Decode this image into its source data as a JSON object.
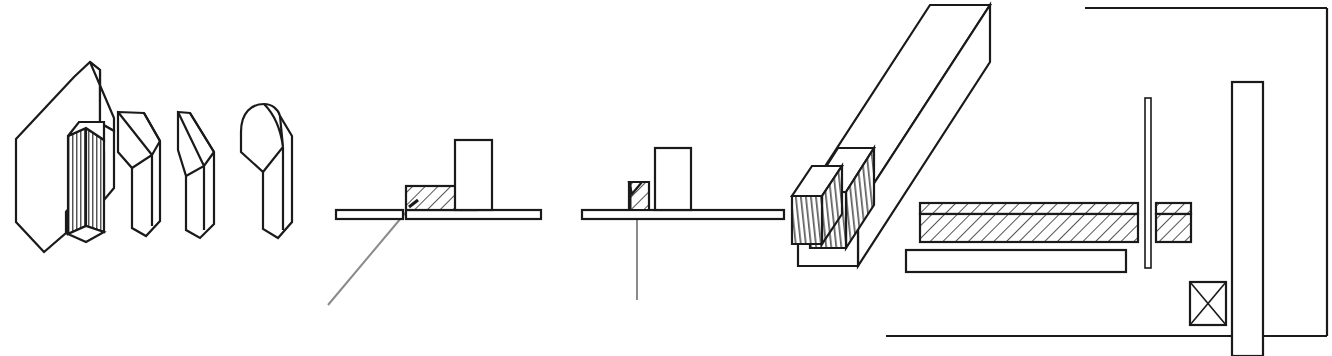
{
  "sheet": {
    "title": "Technical line drawing sheet",
    "width": 1332,
    "height": 356,
    "background_color": "#ffffff",
    "ink_color": "#1a1a1a",
    "leader_color": "#8a8a8a"
  },
  "figures": [
    {
      "id": "fig-left-blade-group",
      "name": "isometric-blade-group",
      "description": "Group of four isometric prismatic blade/chisel tip bodies; leftmost is a large bevelled block with a vertically line-shaded inner post",
      "parts": [
        {
          "name": "large-bevelled-block",
          "shading": "none"
        },
        {
          "name": "ribbed-inner-post",
          "shading": "vertical-line-shading"
        },
        {
          "name": "single-bevel-blade",
          "shading": "none"
        },
        {
          "name": "double-bevel-point-blade",
          "shading": "none"
        },
        {
          "name": "round-nose-blade",
          "shading": "none"
        }
      ]
    },
    {
      "id": "fig-section-a",
      "name": "cross-section-left",
      "description": "Sectional side view: thin horizontal plate split at a seam, a cross-hatched rectangular block seated on the plate, an unhatched upright rectangle to its right, and a grey leader line pointing down-left from the seam",
      "parts": [
        {
          "name": "plate-left-segment",
          "shading": "none"
        },
        {
          "name": "plate-right-segment",
          "shading": "none"
        },
        {
          "name": "hatched-block",
          "shading": "cross-hatch-45"
        },
        {
          "name": "upright-rectangle",
          "shading": "none"
        },
        {
          "name": "leader-line",
          "shading": "none"
        }
      ]
    },
    {
      "id": "fig-section-b",
      "name": "cross-section-right",
      "description": "Sectional side view: continuous thin horizontal plate, a small cross-hatched wedge block standing on it, an unhatched upright rectangle to its right, and a vertical grey leader line descending through the plate",
      "parts": [
        {
          "name": "plate-continuous",
          "shading": "none"
        },
        {
          "name": "hatched-wedge-block",
          "shading": "cross-hatch-45"
        },
        {
          "name": "upright-rectangle",
          "shading": "none"
        },
        {
          "name": "leader-line-vertical",
          "shading": "none"
        }
      ]
    },
    {
      "id": "fig-long-bar",
      "name": "isometric-long-bar-assembly",
      "description": "Long isometric rectangular bar running from upper right to lower left, with two short separated blocks aligned in front of it; the nearer blocks carry vertical line shading on their left faces",
      "parts": [
        {
          "name": "long-bar",
          "shading": "none"
        },
        {
          "name": "mid-block",
          "shading": "vertical-line-shading"
        },
        {
          "name": "front-block",
          "shading": "vertical-line-shading"
        }
      ]
    },
    {
      "id": "fig-plan-section",
      "name": "plan-section-assembly",
      "description": "Orthographic plan/section: a long cross-hatched bar with a thin cap strip, an unhatched bar beneath it, a short cross-hatched block to the right separated by a thin vertical sliver, a tall vertical bar at the right, a small square box with diagonal cross, and an L-shaped outer frame",
      "parts": [
        {
          "name": "long-hatched-bar",
          "shading": "cross-hatch-45"
        },
        {
          "name": "long-hatched-bar-cap-strip",
          "shading": "cross-hatch-45"
        },
        {
          "name": "plain-bar",
          "shading": "none"
        },
        {
          "name": "thin-vertical-sliver",
          "shading": "none"
        },
        {
          "name": "short-hatched-block",
          "shading": "cross-hatch-45"
        },
        {
          "name": "short-hatched-block-cap-strip",
          "shading": "cross-hatch-45"
        },
        {
          "name": "tall-vertical-bar",
          "shading": "none"
        },
        {
          "name": "cross-box",
          "shading": "diagonal-cross"
        },
        {
          "name": "outer-frame-top-rail",
          "shading": "none"
        },
        {
          "name": "outer-frame-right-rail",
          "shading": "none"
        },
        {
          "name": "outer-frame-bottom-rail",
          "shading": "none"
        }
      ]
    }
  ],
  "labels": {
    "visible_text": []
  }
}
